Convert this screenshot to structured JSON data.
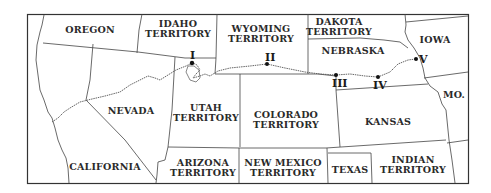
{
  "map": {
    "regions": [
      {
        "id": "oregon",
        "label": "OREGON"
      },
      {
        "id": "idaho",
        "label": "IDAHO\nTERRITORY",
        "line1": "IDAHO",
        "line2": "TERRITORY"
      },
      {
        "id": "wyoming",
        "line1": "WYOMING",
        "line2": "TERRITORY"
      },
      {
        "id": "dakota",
        "line1": "DAKOTA",
        "line2": "TERRITORY"
      },
      {
        "id": "nebraska",
        "label": "NEBRASKA"
      },
      {
        "id": "iowa",
        "label": "IOWA"
      },
      {
        "id": "nevada",
        "label": "NEVADA"
      },
      {
        "id": "utah",
        "line1": "UTAH",
        "line2": "TERRITORY"
      },
      {
        "id": "colorado",
        "line1": "COLORADO",
        "line2": "TERRITORY"
      },
      {
        "id": "kansas",
        "label": "KANSAS"
      },
      {
        "id": "missouri",
        "label": "MO."
      },
      {
        "id": "california",
        "label": "CALIFORNIA"
      },
      {
        "id": "arizona",
        "line1": "ARIZONA",
        "line2": "TERRITORY"
      },
      {
        "id": "new_mexico",
        "line1": "NEW MEXICO",
        "line2": "TERRITORY"
      },
      {
        "id": "texas",
        "label": "TEXAS"
      },
      {
        "id": "indian",
        "line1": "INDIAN",
        "line2": "TERRITORY"
      }
    ],
    "route_points": [
      {
        "id": "I",
        "label": "I"
      },
      {
        "id": "II",
        "label": "II"
      },
      {
        "id": "III",
        "label": "III"
      },
      {
        "id": "IV",
        "label": "IV"
      },
      {
        "id": "V",
        "label": "V"
      }
    ],
    "colors": {
      "border": "#333333",
      "route": "#555555",
      "point": "#111111",
      "background": "#ffffff"
    }
  }
}
